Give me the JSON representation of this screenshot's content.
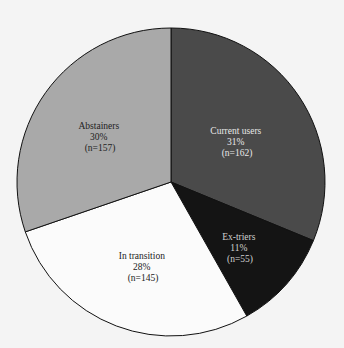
{
  "chart_data": {
    "type": "pie",
    "title": "",
    "start_angle_deg": 0,
    "direction": "clockwise",
    "slices": [
      {
        "label": "Current users",
        "percent": "31%",
        "n": "(n=162)",
        "value": 162,
        "color": "#4a4a4a",
        "text_color": "#e8e8e8"
      },
      {
        "label": "Ex-triers",
        "percent": "11%",
        "n": "(n=55)",
        "value": 55,
        "color": "#141414",
        "text_color": "#d0d0d0"
      },
      {
        "label": "In transition",
        "percent": "28%",
        "n": "(n=145)",
        "value": 145,
        "color": "#fbfbfb",
        "text_color": "#222222"
      },
      {
        "label": "Abstainers",
        "percent": "30%",
        "n": "(n=157)",
        "value": 157,
        "color": "#a9a9a9",
        "text_color": "#222222"
      }
    ],
    "legend": "none",
    "grid": false
  }
}
